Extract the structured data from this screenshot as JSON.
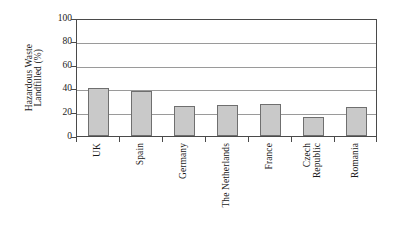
{
  "chart_data": {
    "type": "bar",
    "title": "",
    "subtitle": "",
    "xlabel": "",
    "ylabel": "Hazardous Waste Landfilled (%)",
    "ylabel_lines": [
      "Hazardous Waste",
      "Landfilled (%)"
    ],
    "categories": [
      "UK",
      "Spain",
      "Germany",
      "The Netherlands",
      "France",
      "Czech Republic",
      "Romania"
    ],
    "category_label_lines": [
      [
        "UK"
      ],
      [
        "Spain"
      ],
      [
        "Germany"
      ],
      [
        "The Netherlands"
      ],
      [
        "France"
      ],
      [
        "Czech",
        "Republic"
      ],
      [
        "Romania"
      ]
    ],
    "values": [
      40,
      38,
      25,
      26,
      27,
      16,
      24
    ],
    "ylim": [
      0,
      100
    ],
    "yticks": [
      0,
      20,
      40,
      60,
      80,
      100
    ],
    "ytick_labels": [
      "0",
      "20",
      "40",
      "60",
      "80",
      "100"
    ],
    "grid": true,
    "grid_axis": "y",
    "legend": false,
    "legend_position": "none",
    "bar_fill_color": "#c9c9c9",
    "bar_border_color": "#6f6f6f",
    "gridline_color": "#9a9a9a",
    "axis_color": "#4a4a4a",
    "plot_background": "#ffffff"
  }
}
